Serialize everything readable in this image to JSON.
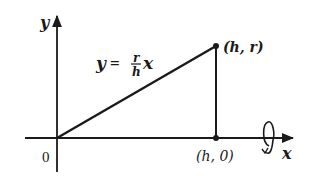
{
  "diagram": {
    "colors": {
      "ink": "#1a1a1a",
      "background": "#ffffff"
    },
    "axes": {
      "x_label": "x",
      "y_label": "y",
      "origin_label": "0"
    },
    "line_equation": {
      "lhs": "y",
      "equals": "=",
      "numerator": "r",
      "denominator": "h",
      "variable": "x"
    },
    "points": [
      {
        "id": "top",
        "label": "(h, r)"
      },
      {
        "id": "base",
        "label": "(h, 0)"
      }
    ],
    "rotation_icon": "rotation-about-x-axis-icon"
  }
}
